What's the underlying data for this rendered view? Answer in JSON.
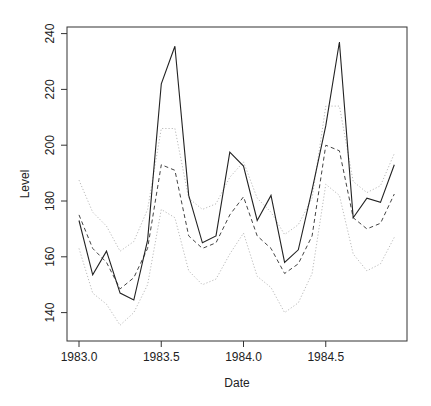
{
  "chart_data": {
    "type": "line",
    "title": "",
    "xlabel": "Date",
    "ylabel": "Level",
    "xlim": [
      1982.93,
      1984.99
    ],
    "ylim": [
      131,
      242
    ],
    "grid": false,
    "legend": null,
    "x_ticks": [
      1983.0,
      1983.5,
      1984.0,
      1984.5
    ],
    "x_tick_labels": [
      "1983.0",
      "1983.5",
      "1984.0",
      "1984.5"
    ],
    "y_ticks": [
      140,
      160,
      180,
      200,
      220,
      240
    ],
    "y_tick_labels": [
      "140",
      "160",
      "180",
      "200",
      "220",
      "240"
    ],
    "x": [
      1983.0,
      1983.083,
      1983.167,
      1983.25,
      1983.333,
      1983.417,
      1983.5,
      1983.583,
      1983.667,
      1983.75,
      1983.833,
      1983.917,
      1984.0,
      1984.083,
      1984.167,
      1984.25,
      1984.333,
      1984.417,
      1984.5,
      1984.583,
      1984.667,
      1984.75,
      1984.833,
      1984.917
    ],
    "series": [
      {
        "name": "Observed",
        "style": "solid",
        "color": "#222222",
        "values": [
          173,
          153.5,
          162,
          147,
          144.5,
          166,
          222,
          235.5,
          182,
          165,
          167.5,
          197.5,
          192.5,
          173,
          182,
          158,
          162.5,
          184,
          207,
          237,
          174,
          181,
          179.5,
          193
        ]
      },
      {
        "name": "Fitted",
        "style": "dashed",
        "color": "#444444",
        "values": [
          175,
          163,
          158,
          148.5,
          152.5,
          163,
          193,
          191,
          167.5,
          163,
          165,
          175,
          181.5,
          167.5,
          163,
          154,
          157.5,
          167.5,
          200,
          198,
          174,
          170,
          172,
          182.5
        ]
      },
      {
        "name": "Upper bound",
        "style": "dotted",
        "color": "#bbbbbb",
        "values": [
          187.5,
          176,
          171,
          162,
          165.5,
          177,
          206,
          206,
          181,
          177,
          179,
          188.5,
          194,
          181,
          176,
          168,
          171.5,
          181,
          214,
          214,
          187,
          183,
          185.5,
          197
        ]
      },
      {
        "name": "Lower bound",
        "style": "dotted",
        "color": "#bbbbbb",
        "values": [
          163,
          147,
          143,
          135.5,
          140,
          150,
          177,
          174,
          155,
          150,
          152,
          161,
          168.5,
          153,
          149,
          140,
          143.5,
          154,
          186,
          182,
          161,
          155,
          157.5,
          167
        ]
      }
    ]
  },
  "plot": {
    "x_axis_title": "Date",
    "y_axis_title": "Level"
  }
}
